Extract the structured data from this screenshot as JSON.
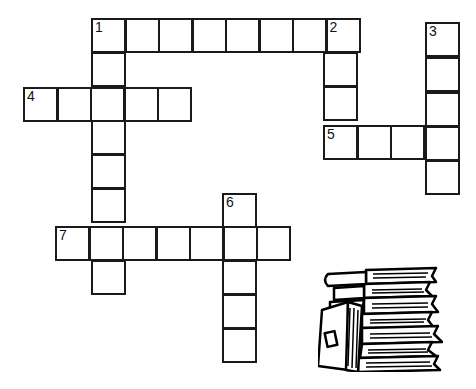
{
  "puzzle": {
    "title": "",
    "cell_size": 34,
    "clues": [
      {
        "number": "1",
        "direction": "across",
        "length": 8
      },
      {
        "number": "2",
        "direction": "down",
        "length": 4
      },
      {
        "number": "3",
        "direction": "down",
        "length": 5
      },
      {
        "number": "4",
        "direction": "across",
        "length": 5
      },
      {
        "number": "5",
        "direction": "across",
        "length": 4
      },
      {
        "number": "6",
        "direction": "down",
        "length": 5
      },
      {
        "number": "7",
        "direction": "across",
        "length": 7
      }
    ],
    "labels": {
      "n1": "1",
      "n2": "2",
      "n3": "3",
      "n4": "4",
      "n5": "5",
      "n6": "6",
      "n7": "7"
    }
  },
  "illustration": {
    "name": "stack-of-books"
  }
}
